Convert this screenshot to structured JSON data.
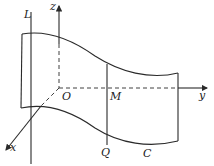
{
  "diagram": {
    "labels": {
      "L": "L",
      "z": "z",
      "x": "x",
      "y": "y",
      "O": "O",
      "M": "M",
      "Q": "Q",
      "C": "C"
    },
    "elements": [
      {
        "id": "line-L",
        "kind": "generatrix line"
      },
      {
        "id": "z-axis",
        "kind": "axis"
      },
      {
        "id": "y-axis",
        "kind": "axis"
      },
      {
        "id": "x-axis",
        "kind": "axis"
      },
      {
        "id": "surface-top-curve",
        "kind": "curve"
      },
      {
        "id": "surface-bottom-curve-C",
        "kind": "curve (directrix C)"
      },
      {
        "id": "segment-MQ",
        "kind": "generatrix through M and Q"
      }
    ],
    "colors": {
      "stroke": "#2a2a2a",
      "background": "#ffffff"
    }
  }
}
